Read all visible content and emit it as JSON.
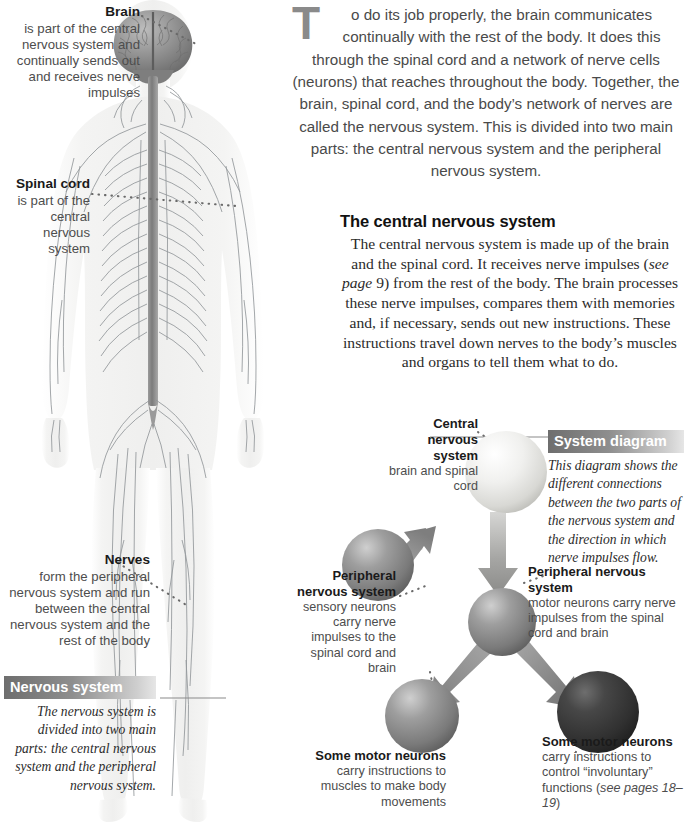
{
  "intro": {
    "dropcap": "T",
    "text": "o do its job properly, the brain communicates continually with the rest of the body. It does this through the spinal cord and a network of nerve cells (neurons) that reaches throughout the body. Together, the brain, spinal cord, and the body’s network of nerves are called the nervous system. This is divided into two main parts: the central nervous system and the peripheral nervous system."
  },
  "cns_section": {
    "heading": "The central nervous system",
    "part1": "The central nervous system is made up of the brain and the spinal cord. It receives nerve impulses (",
    "italic": "see page",
    "part2": " 9) from the rest of the body. The brain processes these nerve impulses, compares them with memories and, if necessary, sends out new instructions. These instructions travel down nerves to the body’s muscles and organs to tell them what to do."
  },
  "callouts": {
    "brain": {
      "title": "Brain",
      "body": "is part of the central nervous system and continually sends out and receives nerve impulses"
    },
    "spinal_cord": {
      "title": "Spinal cord",
      "body": "is part of the central nervous system"
    },
    "nerves": {
      "title": "Nerves",
      "body": "form the peripheral nervous system and run between the central nervous system and the rest of the body"
    }
  },
  "nervous_system_box": {
    "bar": "Nervous system",
    "body": "The nervous system is divided into two main parts: the central nervous system and the peripheral nervous system."
  },
  "system_diagram_box": {
    "bar": "System diagram",
    "body": "This diagram shows the different connections between the two parts of the nervous system and the direction in which nerve impulses flow."
  },
  "diagram_labels": {
    "central": {
      "title": "Central nervous system",
      "body": "brain and spinal cord"
    },
    "peripheral_left": {
      "title": "Peripheral nervous system",
      "body": "sensory neurons carry nerve impulses to the spinal cord and brain"
    },
    "peripheral_right": {
      "title": "Peripheral nervous system",
      "body": "motor neurons carry nerve impulses from the spinal cord and brain"
    },
    "motor_center": {
      "title": "Some motor neurons",
      "body": "carry instructions to muscles to make body movements"
    },
    "motor_right": {
      "title": "Some motor neurons",
      "body_a": "carry instructions to control “involuntary” functions (",
      "body_i": "see pages 18–19",
      "body_b": ")"
    }
  },
  "colors": {
    "sphere_light": "#e8e8e6",
    "sphere_mid": "#8a8a8a",
    "sphere_dark": "#3a3a3a",
    "arrow": "#8f8f8f",
    "bar_dark": "#6e6e6e",
    "text_gray": "#4d4d4d",
    "body_fill": "#f2f2f1",
    "nerve_line": "#8e9296",
    "brain_gray": "#8d8d8d"
  },
  "figure": {
    "alt_name": "human-nervous-system-anatomy"
  }
}
